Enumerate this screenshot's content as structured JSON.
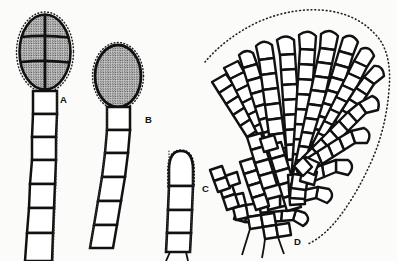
{
  "figure": {
    "background_color": "#fbfbf9",
    "ink_color": "#111111"
  },
  "labels": [
    {
      "id": "A",
      "text": "A",
      "x": 60,
      "y": 95,
      "refers_to": "divided-sporangium-on-filament"
    },
    {
      "id": "B",
      "text": "B",
      "x": 145,
      "y": 115,
      "refers_to": "undivided-sporangium-on-filament"
    },
    {
      "id": "C",
      "text": "C",
      "x": 202,
      "y": 184,
      "refers_to": "empty-terminal-cell-filament"
    },
    {
      "id": "D",
      "text": "D",
      "x": 294,
      "y": 237,
      "refers_to": "radiating-cell-disc"
    }
  ],
  "panels": {
    "A": {
      "label": "A",
      "sporangium": {
        "shape": "oval",
        "fill": "stippled",
        "center_x": 45,
        "center_y": 52,
        "radius_x": 26,
        "radius_y": 38,
        "margin": "dotted",
        "internal_septa": [
          "vertical-median",
          "horizontal-upper",
          "horizontal-lower"
        ],
        "compartments": 6
      },
      "filament": {
        "cell_count": 7,
        "orientation": "vertical",
        "top_x": 45,
        "top_y": 92,
        "bottom_x": 38,
        "bottom_y": 261,
        "cell_width": 22
      }
    },
    "B": {
      "label": "B",
      "sporangium": {
        "shape": "oval",
        "fill": "stippled",
        "center_x": 118,
        "center_y": 76,
        "radius_x": 23,
        "radius_y": 31,
        "margin": "dotted",
        "internal_septa": [],
        "compartments": 1
      },
      "filament": {
        "cell_count": 6,
        "orientation": "curving-left",
        "top_x": 118,
        "top_y": 108,
        "bottom_x": 100,
        "bottom_y": 245,
        "cell_width": 20
      }
    },
    "C": {
      "label": "C",
      "terminal_cell": {
        "shape": "dome",
        "fill": "empty",
        "center_x": 181,
        "center_y": 168,
        "radius_x": 14,
        "radius_y": 19,
        "margin": "dotted"
      },
      "filament": {
        "cell_count": 3,
        "orientation": "vertical",
        "top_x": 181,
        "top_y": 186,
        "bottom_x": 178,
        "bottom_y": 250,
        "cell_width": 19
      }
    },
    "D": {
      "label": "D",
      "disc": {
        "type": "pseudoparenchymatous-radiating-disc",
        "margin": "dotted",
        "origin_x": 250,
        "origin_y": 238,
        "ray_count": 15,
        "cells_per_ray_range": [
          5,
          11
        ],
        "fill": "empty-cells-thick-outline",
        "rhizoids_below": 3
      }
    }
  }
}
